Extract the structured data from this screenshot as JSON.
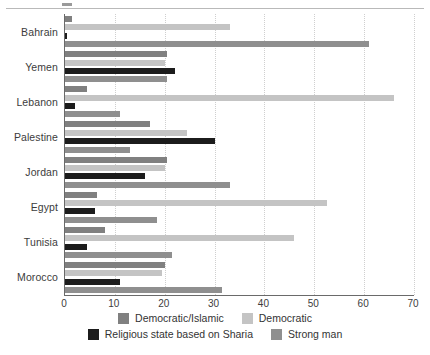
{
  "chart_data": {
    "type": "bar",
    "orientation": "horizontal",
    "title": "",
    "xlabel": "",
    "ylabel": "",
    "xlim": [
      0,
      70
    ],
    "xticks": [
      0,
      10,
      20,
      30,
      40,
      50,
      60,
      70
    ],
    "xtick_labels": [
      "0",
      "10",
      "20",
      "30",
      "40",
      "50",
      "60",
      "70"
    ],
    "grid": "vertical-dotted",
    "legend_position": "bottom",
    "categories": [
      "Bahrain",
      "Yemen",
      "Lebanon",
      "Palestine",
      "Jordan",
      "Egypt",
      "Tunisia",
      "Morocco"
    ],
    "series": [
      {
        "name": "Democratic/Islamic",
        "color": "#808080",
        "values": [
          1.5,
          20.5,
          4.5,
          17,
          20.5,
          6.5,
          8,
          20
        ]
      },
      {
        "name": "Democratic",
        "color": "#c4c4c4",
        "values": [
          33,
          20,
          66,
          24.5,
          20,
          52.5,
          46,
          19.5
        ]
      },
      {
        "name": "Religious state based on Sharia",
        "color": "#1c1c1c",
        "values": [
          0.4,
          22,
          2,
          30,
          16,
          6,
          4.5,
          11
        ]
      },
      {
        "name": "Strong man",
        "color": "#8f8f8f",
        "values": [
          61,
          20.5,
          11,
          13,
          33,
          18.5,
          21.5,
          31.5
        ]
      }
    ]
  },
  "legend": {
    "rows": [
      [
        {
          "label": "Democratic/Islamic",
          "color": "#808080"
        },
        {
          "label": "Democratic",
          "color": "#c4c4c4"
        }
      ],
      [
        {
          "label": "Religious state based on Sharia",
          "color": "#1c1c1c"
        },
        {
          "label": "Strong man",
          "color": "#8f8f8f"
        }
      ]
    ]
  }
}
